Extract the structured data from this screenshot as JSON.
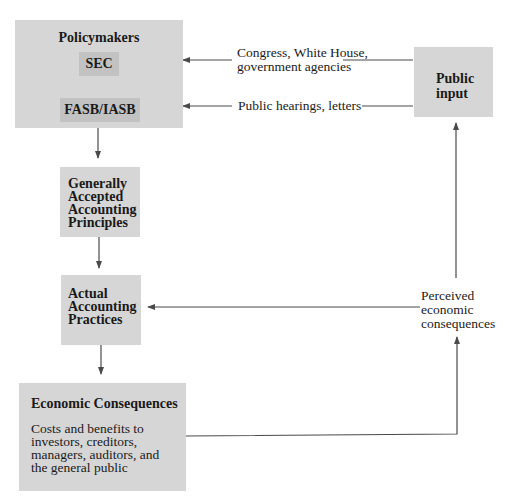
{
  "diagram": {
    "nodes": {
      "policymakers": {
        "title": "Policymakers",
        "children": [
          "SEC",
          "FASB/IASB"
        ]
      },
      "public_input": {
        "lines": [
          "Public",
          "input"
        ]
      },
      "gaap": {
        "lines": [
          "Generally",
          "Accepted",
          "Accounting",
          "Principles"
        ]
      },
      "practices": {
        "lines": [
          "Actual",
          "Accounting",
          "Practices"
        ]
      },
      "economic_consequences": {
        "title": "Economic Consequences",
        "description_lines": [
          "Costs and benefits to",
          "investors, creditors,",
          "managers, auditors, and",
          "the general public"
        ]
      }
    },
    "edge_labels": {
      "congress": [
        "Congress, White House,",
        "government agencies"
      ],
      "hearings": "Public hearings, letters",
      "perceived": [
        "Perceived",
        "economic",
        "consequences"
      ]
    },
    "edges": [
      {
        "from": "public_input",
        "to": "SEC",
        "label": "Congress, White House, government agencies"
      },
      {
        "from": "public_input",
        "to": "FASB/IASB",
        "label": "Public hearings, letters"
      },
      {
        "from": "policymakers",
        "to": "gaap"
      },
      {
        "from": "gaap",
        "to": "practices"
      },
      {
        "from": "practices",
        "to": "economic_consequences"
      },
      {
        "from": "economic_consequences",
        "to": "perceived"
      },
      {
        "from": "perceived",
        "to": "practices"
      },
      {
        "from": "perceived",
        "to": "public_input"
      }
    ],
    "colors": {
      "box_fill": "#d6d6d6",
      "inner_fill": "#c2c2c2",
      "line": "#4a4a4a"
    }
  }
}
